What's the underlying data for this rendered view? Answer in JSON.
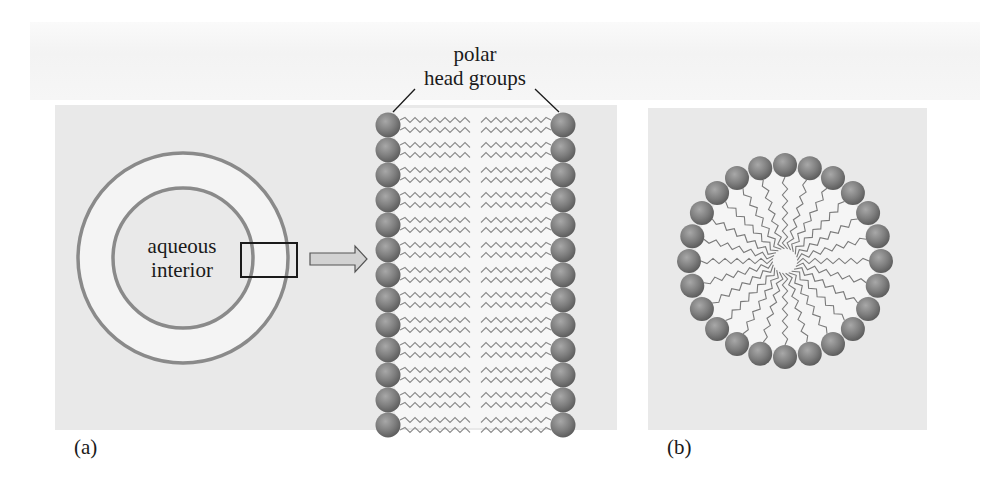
{
  "figure": {
    "panels": [
      {
        "id": "a",
        "label": "(a)",
        "description": "Liposome cross-section (bilayer vesicle) with zoomed bilayer",
        "interior_label_line1": "aqueous",
        "interior_label_line2": "interior",
        "callout_line1": "polar",
        "callout_line2": "head groups",
        "bilayer_heads_per_leaflet": 13,
        "tails_per_head": 2
      },
      {
        "id": "b",
        "label": "(b)",
        "description": "Micelle",
        "heads": 24,
        "tails_per_head": 1
      }
    ],
    "colors": {
      "panel_bg": "#e9e9e9",
      "membrane_ring": "#8a8a8a",
      "ring_interior": "#f4f4f4",
      "head_group": "#7d7d7d",
      "tail": "#8c8c8c",
      "arrow_fill": "#d2d2d2",
      "text": "#1a1a1a"
    }
  }
}
